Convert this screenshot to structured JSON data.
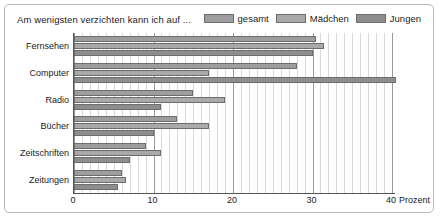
{
  "chart_data": {
    "type": "bar",
    "orientation": "horizontal",
    "title": "Am wenigsten verzichten kann ich auf ...",
    "xlabel": "Prozent",
    "ylabel": "",
    "xlim": [
      0,
      40.5
    ],
    "xticks": [
      0,
      10,
      20,
      30,
      40
    ],
    "xtick_labels": [
      "0",
      "10",
      "20",
      "30",
      "40"
    ],
    "unit_label": "Prozent",
    "grid": true,
    "grid_axis": "x",
    "grid_minor_step": 1,
    "grid_major_step": 10,
    "legend_position": "top-right",
    "categories": [
      "Fernsehen",
      "Computer",
      "Radio",
      "Bücher",
      "Zeitschriften",
      "Zeitungen"
    ],
    "series": [
      {
        "name": "gesamt",
        "color": "#9d9d9d",
        "values": [
          30.5,
          28.0,
          15.0,
          13.0,
          9.0,
          6.0
        ]
      },
      {
        "name": "Mädchen",
        "color": "#a9a9a9",
        "values": [
          31.5,
          17.0,
          19.0,
          17.0,
          11.0,
          6.5
        ]
      },
      {
        "name": "Jungen",
        "color": "#8d8d8d",
        "values": [
          30.0,
          40.5,
          11.0,
          10.0,
          7.0,
          5.5
        ]
      }
    ]
  },
  "colors": {
    "frame_border": "#b8b8b8",
    "axis": "#555555",
    "gridline_minor": "#d9d9d9",
    "gridline_major": "#9a9a9a",
    "text": "#1b1b1b",
    "background": "#ffffff"
  }
}
